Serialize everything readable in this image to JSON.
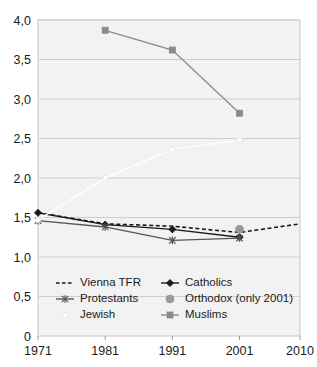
{
  "chart_data": {
    "type": "line",
    "title": "",
    "xlabel": "",
    "ylabel": "",
    "x": [
      1971,
      1981,
      1991,
      2001,
      2010
    ],
    "xtick_labels": [
      "1971",
      "1981",
      "1991",
      "2001",
      "2010"
    ],
    "ytick_labels": [
      "0",
      "0,5",
      "1,0",
      "1,5",
      "2,0",
      "2,5",
      "3,0",
      "3,5",
      "4,0"
    ],
    "ytick_values": [
      0,
      0.5,
      1.0,
      1.5,
      2.0,
      2.5,
      3.0,
      3.5,
      4.0
    ],
    "ylim": [
      0,
      4.0
    ],
    "xlim": [
      1971,
      2010
    ],
    "grid": "horizontal",
    "legend_position": "inside-bottom-left",
    "series": [
      {
        "name": "Vienna TFR",
        "style": "dashed",
        "color": "#1a1a1a",
        "marker": "none",
        "x": [
          1971,
          1981,
          1991,
          2001,
          2010
        ],
        "values": [
          1.56,
          1.42,
          1.39,
          1.31,
          1.42
        ]
      },
      {
        "name": "Catholics",
        "style": "solid",
        "color": "#1a1a1a",
        "marker": "diamond",
        "x": [
          1971,
          1981,
          1991,
          2001
        ],
        "values": [
          1.56,
          1.41,
          1.35,
          1.25
        ]
      },
      {
        "name": "Protestants",
        "style": "solid",
        "color": "#555555",
        "marker": "cross",
        "x": [
          1971,
          1981,
          1991,
          2001
        ],
        "values": [
          1.46,
          1.38,
          1.21,
          1.24
        ]
      },
      {
        "name": "Orthodox (only 2001)",
        "style": "none",
        "color": "#9a9a9a",
        "marker": "circle",
        "x": [
          2001
        ],
        "values": [
          1.35
        ]
      },
      {
        "name": "Jewish",
        "style": "solid",
        "color": "#fdfdfd",
        "marker": "circle-open",
        "x": [
          1971,
          1981,
          1991,
          2001
        ],
        "values": [
          1.47,
          2.0,
          2.36,
          2.48
        ]
      },
      {
        "name": "Muslims",
        "style": "solid",
        "color": "#8a8a8a",
        "marker": "square",
        "x": [
          1981,
          1991,
          2001
        ],
        "values": [
          3.87,
          3.62,
          2.82
        ]
      }
    ]
  },
  "legend": {
    "entries": [
      {
        "label": "Vienna TFR",
        "marker": "dashed-line",
        "col": 0,
        "row": 0
      },
      {
        "label": "Catholics",
        "marker": "diamond-line",
        "col": 1,
        "row": 0
      },
      {
        "label": "Protestants",
        "marker": "cross-line",
        "col": 0,
        "row": 1
      },
      {
        "label": "Orthodox (only 2001)",
        "marker": "circle-dot",
        "col": 1,
        "row": 1
      },
      {
        "label": "Jewish",
        "marker": "circle-open-faint",
        "col": 0,
        "row": 2
      },
      {
        "label": "Muslims",
        "marker": "square-line",
        "col": 1,
        "row": 2
      }
    ]
  },
  "colors": {
    "plot_background": "#f2f2f2",
    "plot_border": "#c8c8c8",
    "gridline": "#cfcfcf",
    "text": "#1a1a1a",
    "catholics": "#1a1a1a",
    "protestants": "#555555",
    "orthodox": "#9a9a9a",
    "muslims": "#8a8a8a",
    "jewish": "#fdfdfd",
    "vienna_tfr": "#1a1a1a"
  }
}
